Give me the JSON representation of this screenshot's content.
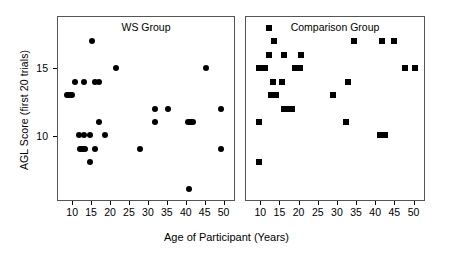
{
  "chart_data": {
    "type": "scatter",
    "title": "",
    "xlabel": "Age of Participant (Years)",
    "ylabel": "AGL Score (first 20 trials)",
    "xlim": [
      6,
      53
    ],
    "ylim": [
      5.2,
      18.8
    ],
    "xticks": [
      10,
      15,
      20,
      25,
      30,
      35,
      40,
      45,
      50
    ],
    "yticks": [
      10,
      15
    ],
    "grid": false,
    "legend": "none",
    "panels": [
      {
        "name": "ws",
        "label": "WS Group",
        "marker": "circle",
        "points": [
          {
            "x": 9,
            "y": 13,
            "count": 2
          },
          {
            "x": 10.5,
            "y": 14,
            "count": 1
          },
          {
            "x": 11.5,
            "y": 10,
            "count": 1
          },
          {
            "x": 12.5,
            "y": 9,
            "count": 2
          },
          {
            "x": 13,
            "y": 10,
            "count": 1
          },
          {
            "x": 13,
            "y": 14,
            "count": 1
          },
          {
            "x": 14.5,
            "y": 8,
            "count": 1
          },
          {
            "x": 14.5,
            "y": 10,
            "count": 1
          },
          {
            "x": 15,
            "y": 17,
            "count": 1
          },
          {
            "x": 16,
            "y": 9,
            "count": 1
          },
          {
            "x": 16,
            "y": 14,
            "count": 1
          },
          {
            "x": 17,
            "y": 14,
            "count": 1
          },
          {
            "x": 17,
            "y": 11,
            "count": 1
          },
          {
            "x": 18.5,
            "y": 10,
            "count": 1
          },
          {
            "x": 21.5,
            "y": 15,
            "count": 1
          },
          {
            "x": 28,
            "y": 9,
            "count": 1
          },
          {
            "x": 32,
            "y": 12,
            "count": 1
          },
          {
            "x": 32,
            "y": 11,
            "count": 1
          },
          {
            "x": 35.5,
            "y": 12,
            "count": 1
          },
          {
            "x": 41,
            "y": 6,
            "count": 1
          },
          {
            "x": 41.5,
            "y": 11,
            "count": 2
          },
          {
            "x": 45.5,
            "y": 15,
            "count": 1
          },
          {
            "x": 49.5,
            "y": 12,
            "count": 1
          },
          {
            "x": 49.5,
            "y": 9,
            "count": 1
          }
        ]
      },
      {
        "name": "comparison",
        "label": "Comparison Group",
        "marker": "square",
        "points": [
          {
            "x": 9.5,
            "y": 8,
            "count": 1
          },
          {
            "x": 9.5,
            "y": 11,
            "count": 1
          },
          {
            "x": 9.5,
            "y": 15,
            "count": 1
          },
          {
            "x": 11,
            "y": 15,
            "count": 1
          },
          {
            "x": 12,
            "y": 18,
            "count": 1
          },
          {
            "x": 12,
            "y": 16,
            "count": 1
          },
          {
            "x": 12.5,
            "y": 13,
            "count": 1
          },
          {
            "x": 13,
            "y": 14,
            "count": 1
          },
          {
            "x": 13.5,
            "y": 17,
            "count": 1
          },
          {
            "x": 14,
            "y": 13,
            "count": 1
          },
          {
            "x": 15.5,
            "y": 14,
            "count": 1
          },
          {
            "x": 16,
            "y": 16,
            "count": 1
          },
          {
            "x": 16,
            "y": 12,
            "count": 1
          },
          {
            "x": 17.5,
            "y": 12,
            "count": 2
          },
          {
            "x": 19.5,
            "y": 15,
            "count": 2
          },
          {
            "x": 20.5,
            "y": 16,
            "count": 1
          },
          {
            "x": 29,
            "y": 13,
            "count": 1
          },
          {
            "x": 32.5,
            "y": 11,
            "count": 1
          },
          {
            "x": 33,
            "y": 14,
            "count": 1
          },
          {
            "x": 34.5,
            "y": 17,
            "count": 1
          },
          {
            "x": 42,
            "y": 10,
            "count": 2
          },
          {
            "x": 42,
            "y": 17,
            "count": 1
          },
          {
            "x": 45,
            "y": 17,
            "count": 1
          },
          {
            "x": 48,
            "y": 15,
            "count": 1
          },
          {
            "x": 50.5,
            "y": 15,
            "count": 1
          }
        ]
      }
    ]
  }
}
